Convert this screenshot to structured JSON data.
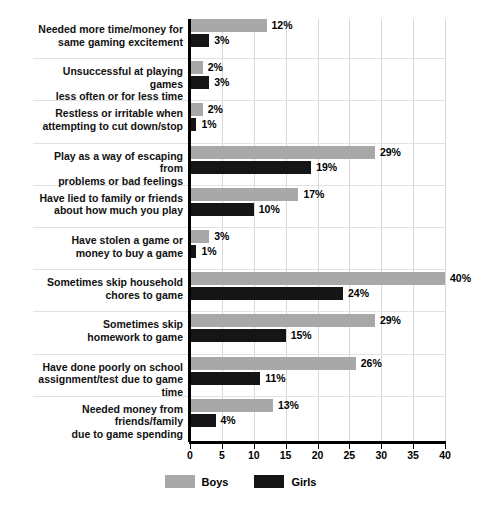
{
  "chart_data": {
    "type": "bar",
    "orientation": "horizontal",
    "title": "",
    "xlabel": "",
    "ylabel": "",
    "xlim": [
      0,
      40
    ],
    "xticks": [
      0,
      5,
      10,
      15,
      20,
      25,
      30,
      35,
      40
    ],
    "xtick_labels": [
      "0",
      "5",
      "10",
      "15",
      "20",
      "25",
      "30",
      "35",
      "40"
    ],
    "grid": true,
    "legend_position": "bottom-center",
    "value_suffix": "%",
    "categories": [
      "Needed more time/money for same gaming excitement",
      "Unsuccessful at playing games less often or for less time",
      "Restless or irritable when attempting to cut down/stop",
      "Play as a way of escaping from problems or bad feelings",
      "Have lied to family or friends about how much you play",
      "Have stolen a game or money to buy a game",
      "Sometimes skip household chores to game",
      "Sometimes skip homework to game",
      "Have done poorly on school assignment/test due to game time",
      "Needed money from friends/family due to game spending"
    ],
    "category_lines": [
      [
        "Needed more time/money for",
        "same gaming excitement"
      ],
      [
        "Unsuccessful at playing games",
        "less often or for less time"
      ],
      [
        "Restless or irritable when",
        "attempting to cut down/stop"
      ],
      [
        "Play as a way of escaping from",
        "problems or bad feelings"
      ],
      [
        "Have lied to family or friends",
        "about how much you play"
      ],
      [
        "Have stolen a game or",
        "money to buy a game"
      ],
      [
        "Sometimes skip household",
        "chores to game"
      ],
      [
        "Sometimes skip",
        "homework to game"
      ],
      [
        "Have done poorly on school",
        "assignment/test due to game time"
      ],
      [
        "Needed money from friends/family",
        "due to game spending"
      ]
    ],
    "series": [
      {
        "name": "Boys",
        "color": "#a8a8a8",
        "values": [
          12,
          2,
          2,
          29,
          17,
          3,
          40,
          29,
          26,
          13
        ],
        "labels": [
          "12%",
          "2%",
          "2%",
          "29%",
          "17%",
          "3%",
          "40%",
          "29%",
          "26%",
          "13%"
        ]
      },
      {
        "name": "Girls",
        "color": "#151515",
        "values": [
          3,
          3,
          1,
          19,
          10,
          1,
          24,
          15,
          11,
          4
        ],
        "labels": [
          "3%",
          "3%",
          "1%",
          "19%",
          "10%",
          "1%",
          "24%",
          "15%",
          "11%",
          "4%"
        ]
      }
    ]
  },
  "legend": {
    "items": [
      {
        "label": "Boys",
        "color": "#a8a8a8"
      },
      {
        "label": "Girls",
        "color": "#151515"
      }
    ]
  },
  "colors": {
    "boys": "#a8a8a8",
    "girls": "#151515",
    "gridline": "#d8d8d8",
    "axis": "#000000",
    "background": "#ffffff"
  }
}
